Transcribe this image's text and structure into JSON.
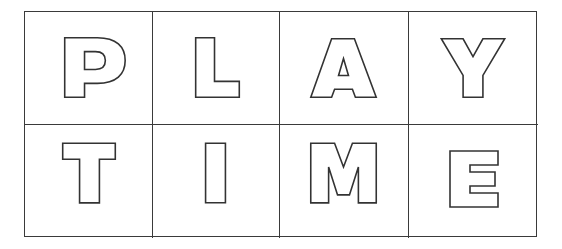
{
  "style": {
    "line_color": "#3a3a3a",
    "glyph_stroke": "#333333",
    "background": "#ffffff"
  },
  "rows": [
    {
      "word": "PLAY",
      "cells": [
        {
          "letter": "P"
        },
        {
          "letter": "L"
        },
        {
          "letter": "A"
        },
        {
          "letter": "Y"
        }
      ]
    },
    {
      "word": "TIME",
      "cells": [
        {
          "letter": "T"
        },
        {
          "letter": "I"
        },
        {
          "letter": "M"
        },
        {
          "letter": "E"
        }
      ]
    }
  ]
}
